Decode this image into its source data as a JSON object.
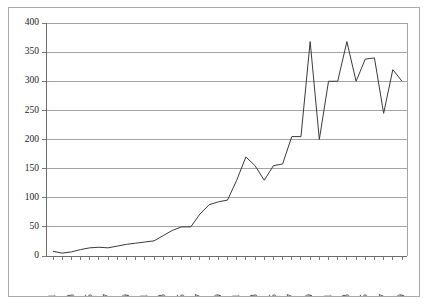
{
  "chart_data": {
    "type": "line",
    "title": "",
    "xlabel": "",
    "ylabel": "",
    "ylim": [
      0,
      400
    ],
    "ytick_values": [
      0,
      50,
      100,
      150,
      200,
      250,
      300,
      350,
      400
    ],
    "ytick_labels": [
      "0",
      "50",
      "100",
      "150",
      "200",
      "250",
      "300",
      "350",
      "400"
    ],
    "grid": true,
    "legend": "none",
    "xlim": [
      1871,
      1909
    ],
    "x": [
      1871,
      1872,
      1873,
      1874,
      1875,
      1876,
      1877,
      1878,
      1879,
      1880,
      1881,
      1882,
      1883,
      1884,
      1885,
      1886,
      1887,
      1888,
      1889,
      1890,
      1891,
      1892,
      1893,
      1894,
      1895,
      1896,
      1897,
      1898,
      1899,
      1900,
      1901,
      1902,
      1903,
      1904,
      1905,
      1906,
      1907,
      1908,
      1909
    ],
    "xtick_labels_all": [
      "1871",
      "1872",
      "1873",
      "1874",
      "1875",
      "1876",
      "1877",
      "1878",
      "1879",
      "1880",
      "1881",
      "1882",
      "1883",
      "1884",
      "1885",
      "1886",
      "1887",
      "1888",
      "1889",
      "1890",
      "1891",
      "1892",
      "1893",
      "1894",
      "1895",
      "1896",
      "1897",
      "1898",
      "1899",
      "1900",
      "1901",
      "1902",
      "1903",
      "1904",
      "1905",
      "1906",
      "1907",
      "1908",
      "1909"
    ],
    "xtick_labels_shown": [
      "1871",
      "1873",
      "1875",
      "1877",
      "1879",
      "1881",
      "1883",
      "1885",
      "1887",
      "1889",
      "1891",
      "1893",
      "1895",
      "1897",
      "1899",
      "1901",
      "1903",
      "1905",
      "1907",
      "1909"
    ],
    "values": [
      8,
      5,
      7,
      11,
      14,
      15,
      14,
      17,
      20,
      22,
      24,
      26,
      35,
      44,
      50,
      50,
      72,
      88,
      93,
      96,
      130,
      170,
      155,
      130,
      155,
      158,
      205,
      205,
      368,
      200,
      300,
      300,
      368,
      300,
      338,
      340,
      245,
      320,
      300
    ],
    "series": [
      {
        "name": "series-1",
        "values": [
          8,
          5,
          7,
          11,
          14,
          15,
          14,
          17,
          20,
          22,
          24,
          26,
          35,
          44,
          50,
          50,
          72,
          88,
          93,
          96,
          130,
          170,
          155,
          130,
          155,
          158,
          205,
          205,
          368,
          200,
          300,
          300,
          368,
          300,
          338,
          340,
          245,
          320,
          300
        ]
      }
    ],
    "line_color": "#3a3a3a",
    "grid_color": "#9a9a9a",
    "background_color": "#ffffff",
    "border_color": "#a9a9a9"
  }
}
